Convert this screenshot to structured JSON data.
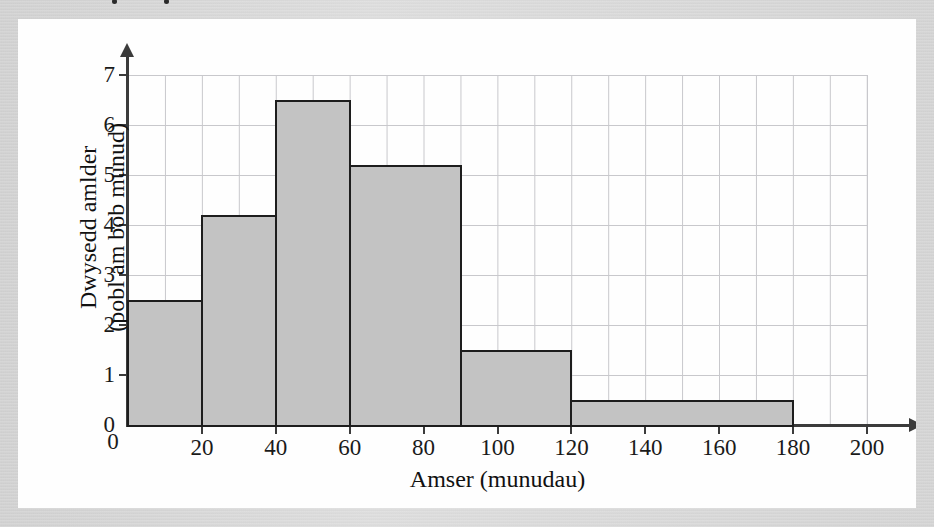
{
  "page": {
    "background_color": "#fefefe",
    "border_color": "#d4d4d4"
  },
  "chart_data": {
    "type": "bar",
    "subtype": "histogram",
    "title": "",
    "xlabel": "Amser (munudau)",
    "ylabel_line1": "Dwysedd amlder",
    "ylabel_line2": "(pobl am bob munud)",
    "xlim": [
      0,
      200
    ],
    "ylim": [
      0,
      7
    ],
    "grid": true,
    "grid_x_step": 10,
    "grid_y_step": 1,
    "legend": "none",
    "x_tick_labels": [
      "0",
      "20",
      "40",
      "60",
      "80",
      "100",
      "120",
      "140",
      "160",
      "180",
      "200"
    ],
    "x_tick_values": [
      0,
      20,
      40,
      60,
      80,
      100,
      120,
      140,
      160,
      180,
      200
    ],
    "y_tick_labels": [
      "0",
      "1",
      "2",
      "3",
      "4",
      "5",
      "6",
      "7"
    ],
    "y_tick_values": [
      0,
      1,
      2,
      3,
      4,
      5,
      6,
      7
    ],
    "bar_fill_color": "#c3c3c3",
    "bar_edge_color": "#1d1d1d",
    "bins": [
      {
        "start": 0,
        "end": 20,
        "value": 2.5
      },
      {
        "start": 20,
        "end": 40,
        "value": 4.2
      },
      {
        "start": 40,
        "end": 60,
        "value": 6.5
      },
      {
        "start": 60,
        "end": 90,
        "value": 5.2
      },
      {
        "start": 90,
        "end": 120,
        "value": 1.5
      },
      {
        "start": 120,
        "end": 180,
        "value": 0.5
      }
    ],
    "categories": [
      "0-20",
      "20-40",
      "40-60",
      "60-90",
      "90-120",
      "120-180"
    ],
    "values": [
      2.5,
      4.2,
      6.5,
      5.2,
      1.5,
      0.5
    ]
  }
}
